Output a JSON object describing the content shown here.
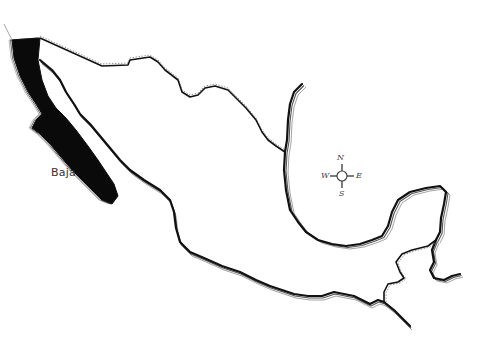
{
  "map": {
    "title": "",
    "subject": "Mexico outline",
    "highlighted_region": {
      "label": "Baja",
      "fill_color": "#0a0a0a"
    },
    "compass": {
      "north": "N",
      "south": "S",
      "east": "E",
      "west": "W"
    },
    "colors": {
      "background": "#ffffff",
      "coastline": "#111111",
      "echo_line": "#9a9a9a"
    }
  }
}
